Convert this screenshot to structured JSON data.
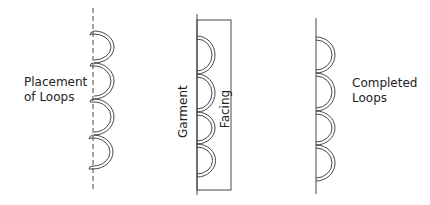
{
  "panels": [
    {
      "id": "placement",
      "label_lines": [
        "Placement",
        "of Loops"
      ],
      "line_style": "dashed",
      "loop_count": 4
    },
    {
      "id": "facing",
      "labels": {
        "garment": "Garment",
        "facing": "Facing"
      },
      "line_style": "solid",
      "loop_count": 4
    },
    {
      "id": "completed",
      "label_lines": [
        "Completed",
        "Loops"
      ],
      "line_style": "solid",
      "loop_count": 4
    }
  ],
  "colors": {
    "stroke": "#333333",
    "text": "#222222",
    "background": "#ffffff"
  }
}
